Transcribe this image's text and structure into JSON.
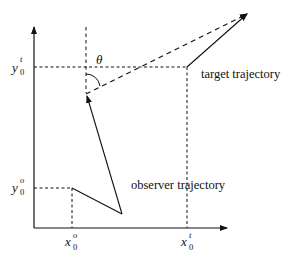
{
  "diagram": {
    "type": "bearing-geometry",
    "labels": {
      "y_target": {
        "base": "y",
        "sub": "0",
        "sup": "t"
      },
      "y_observer": {
        "base": "y",
        "sub": "0",
        "sup": "o"
      },
      "x_observer": {
        "base": "x",
        "sub": "0",
        "sup": "o"
      },
      "x_target": {
        "base": "x",
        "sub": "0",
        "sup": "t"
      },
      "angle": "θ",
      "target_trajectory": "target trajectory",
      "observer_trajectory": "observer trajectory"
    },
    "colors": {
      "line": "#111111",
      "background": "#ffffff"
    }
  }
}
